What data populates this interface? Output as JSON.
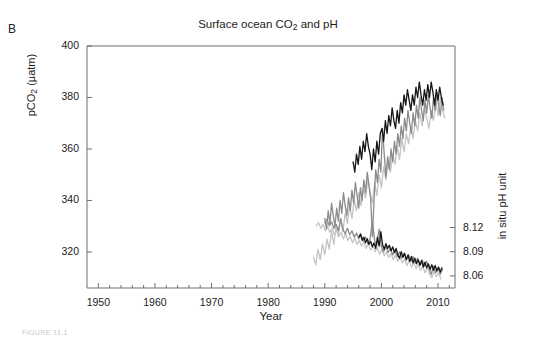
{
  "figure": {
    "panel_label": "B",
    "caption": "FIGURE 11.1"
  },
  "chart_data": {
    "type": "line",
    "title": "Surface ocean CO2 and pH",
    "title_main": "Surface ocean CO",
    "title_sub": "2",
    "title_tail": " and pH",
    "xlabel": "Year",
    "ylabel_main": "pCO",
    "ylabel_sub": "2",
    "ylabel_tail": " (µatm)",
    "ylabel": "pCO2 (µatm)",
    "y2label": "in situ pH unit",
    "xlim": [
      1948,
      2013
    ],
    "ylim": [
      306,
      400
    ],
    "y2lim": [
      8.045,
      8.135
    ],
    "xticks": [
      1950,
      1960,
      1970,
      1980,
      1990,
      2000,
      2010
    ],
    "xtick_labels": [
      "1950",
      "1960",
      "1970",
      "1980",
      "1990",
      "2000",
      "2010"
    ],
    "xminor_step": 2,
    "yticks": [
      320,
      340,
      360,
      380,
      400
    ],
    "ytick_labels": [
      "320",
      "340",
      "360",
      "380",
      "400"
    ],
    "y2ticks": [
      8.06,
      8.09,
      8.12
    ],
    "y2tick_labels": [
      "8.06",
      "8.09",
      "8.12"
    ],
    "grid": false,
    "legend": "none",
    "colors": {
      "series_black": "#161616",
      "series_gray": "#8c8c8c",
      "series_light": "#c4c4c4",
      "axis": "#6f6f6f"
    },
    "series": [
      {
        "name": "pCO2 station black",
        "axis": "left",
        "color": "#161616",
        "x": [
          1995.0,
          1995.3,
          1995.6,
          1995.9,
          1996.2,
          1996.5,
          1996.8,
          1997.1,
          1997.4,
          1997.7,
          1998.0,
          1998.3,
          1998.6,
          1998.9,
          1999.2,
          1999.5,
          1999.8,
          2000.1,
          2000.4,
          2000.7,
          2001.0,
          2001.3,
          2001.6,
          2001.9,
          2002.2,
          2002.5,
          2002.8,
          2003.1,
          2003.4,
          2003.7,
          2004.0,
          2004.3,
          2004.6,
          2004.9,
          2005.2,
          2005.5,
          2005.8,
          2006.1,
          2006.4,
          2006.7,
          2007.0,
          2007.3,
          2007.6,
          2007.9,
          2008.2,
          2008.5,
          2008.8,
          2009.1,
          2009.4,
          2009.7,
          2010.0,
          2010.3,
          2010.6,
          2010.9
        ],
        "y": [
          355.0,
          351.0,
          358.0,
          354.0,
          361.0,
          356.0,
          363.0,
          359.0,
          366.0,
          361.0,
          358.0,
          352.0,
          360.0,
          355.0,
          363.0,
          358.0,
          366.0,
          368.0,
          363.0,
          371.0,
          366.0,
          373.0,
          369.0,
          376.0,
          371.0,
          368.0,
          375.0,
          370.0,
          378.0,
          374.0,
          381.0,
          377.0,
          383.0,
          379.0,
          375.0,
          381.0,
          377.0,
          384.0,
          380.0,
          386.0,
          381.0,
          377.0,
          383.0,
          379.0,
          385.0,
          380.0,
          386.0,
          382.0,
          377.0,
          383.0,
          379.0,
          384.0,
          380.0,
          377.0
        ]
      },
      {
        "name": "pCO2 station gray",
        "axis": "left",
        "color": "#8c8c8c",
        "x": [
          1990.0,
          1990.3,
          1990.6,
          1990.9,
          1991.2,
          1991.5,
          1991.8,
          1992.1,
          1992.4,
          1992.7,
          1993.0,
          1993.3,
          1993.6,
          1993.9,
          1994.2,
          1994.5,
          1994.8,
          1995.1,
          1995.4,
          1995.7,
          1996.0,
          1996.3,
          1996.6,
          1996.9,
          1997.2,
          1997.5,
          1997.8,
          1998.1,
          1998.4,
          1998.7,
          1999.0,
          1999.3,
          1999.6,
          1999.9,
          2000.2,
          2000.5,
          2000.8,
          2001.1,
          2001.4,
          2001.7,
          2002.0,
          2002.3,
          2002.6,
          2002.9,
          2003.2,
          2003.5,
          2003.8,
          2004.1,
          2004.4,
          2004.7,
          2005.0,
          2005.3,
          2005.6,
          2005.9,
          2006.2,
          2006.5,
          2006.8,
          2007.1,
          2007.4,
          2007.7,
          2008.0,
          2008.3,
          2008.6,
          2008.9,
          2009.2,
          2009.5,
          2009.8,
          2010.1,
          2010.4,
          2010.7,
          2011.0
        ],
        "y": [
          333.0,
          329.0,
          336.0,
          331.0,
          339.0,
          334.0,
          330.0,
          337.0,
          332.0,
          340.0,
          335.0,
          343.0,
          338.0,
          334.0,
          341.0,
          336.0,
          344.0,
          339.0,
          347.0,
          342.0,
          337.0,
          345.0,
          340.0,
          348.0,
          343.0,
          351.0,
          346.0,
          341.0,
          326.0,
          340.0,
          352.0,
          347.0,
          356.0,
          351.0,
          368.0,
          358.0,
          349.0,
          357.0,
          352.0,
          360.0,
          355.0,
          363.0,
          358.0,
          366.0,
          361.0,
          369.0,
          364.0,
          372.0,
          367.0,
          375.0,
          370.0,
          366.0,
          374.0,
          369.0,
          377.0,
          372.0,
          380.0,
          375.0,
          371.0,
          379.0,
          374.0,
          381.0,
          376.0,
          372.0,
          380.0,
          375.0,
          382.0,
          377.0,
          373.0,
          380.0,
          375.0
        ]
      },
      {
        "name": "pCO2 station light",
        "axis": "left",
        "color": "#c4c4c4",
        "x": [
          1988.0,
          1988.4,
          1988.8,
          1989.2,
          1989.6,
          1990.0,
          1990.4,
          1990.8,
          1991.2,
          1991.6,
          1992.0,
          1992.4,
          1992.8,
          1993.2,
          1993.6,
          1994.0,
          1994.4,
          1994.8,
          1995.2,
          1995.6,
          1996.0,
          1996.4,
          1996.8,
          1997.2,
          1997.6,
          1998.0,
          1998.4,
          1998.8,
          1999.2,
          1999.6,
          2000.0,
          2000.4,
          2000.8,
          2001.2,
          2001.6,
          2002.0,
          2002.4,
          2002.8,
          2003.2,
          2003.6,
          2004.0,
          2004.4,
          2004.8,
          2005.2,
          2005.6,
          2006.0,
          2006.4,
          2006.8,
          2007.2,
          2007.6,
          2008.0,
          2008.4,
          2008.8,
          2009.2,
          2009.6,
          2010.0,
          2010.4,
          2010.8,
          2011.2
        ],
        "y": [
          318.0,
          315.0,
          321.0,
          317.0,
          323.0,
          319.0,
          325.0,
          321.0,
          328.0,
          323.0,
          330.0,
          326.0,
          333.0,
          328.0,
          335.0,
          331.0,
          338.0,
          333.0,
          340.0,
          336.0,
          343.0,
          338.0,
          345.0,
          341.0,
          348.0,
          343.0,
          339.0,
          347.0,
          342.0,
          350.0,
          345.0,
          353.0,
          348.0,
          356.0,
          351.0,
          358.0,
          354.0,
          361.0,
          356.0,
          364.0,
          359.0,
          366.0,
          362.0,
          369.0,
          364.0,
          371.0,
          367.0,
          374.0,
          369.0,
          376.0,
          372.0,
          368.0,
          375.0,
          371.0,
          378.0,
          373.0,
          380.0,
          375.0,
          372.0
        ]
      },
      {
        "name": "pH station black",
        "axis": "right",
        "color": "#161616",
        "x": [
          1996.0,
          1996.3,
          1996.6,
          1996.9,
          1997.2,
          1997.5,
          1997.8,
          1998.1,
          1998.4,
          1998.7,
          1999.0,
          1999.3,
          1999.6,
          1999.9,
          2000.2,
          2000.5,
          2000.8,
          2001.1,
          2001.4,
          2001.7,
          2002.0,
          2002.3,
          2002.6,
          2002.9,
          2003.2,
          2003.5,
          2003.8,
          2004.1,
          2004.4,
          2004.7,
          2005.0,
          2005.3,
          2005.6,
          2005.9,
          2006.2,
          2006.5,
          2006.8,
          2007.1,
          2007.4,
          2007.7,
          2008.0,
          2008.3,
          2008.6,
          2008.9,
          2009.2,
          2009.5,
          2009.8,
          2010.1,
          2010.4,
          2010.7
        ],
        "y": [
          8.108,
          8.112,
          8.104,
          8.108,
          8.101,
          8.106,
          8.099,
          8.103,
          8.096,
          8.101,
          8.094,
          8.108,
          8.097,
          8.115,
          8.099,
          8.093,
          8.1,
          8.094,
          8.098,
          8.091,
          8.096,
          8.089,
          8.094,
          8.086,
          8.082,
          8.09,
          8.083,
          8.088,
          8.08,
          8.086,
          8.078,
          8.084,
          8.076,
          8.082,
          8.075,
          8.08,
          8.073,
          8.079,
          8.071,
          8.077,
          8.07,
          8.075,
          8.068,
          8.074,
          8.067,
          8.073,
          8.066,
          8.071,
          8.065,
          8.07
        ]
      },
      {
        "name": "pH station gray",
        "axis": "right",
        "color": "#8c8c8c",
        "x": [
          1990.0,
          1990.4,
          1990.8,
          1991.2,
          1991.6,
          1992.0,
          1992.4,
          1992.8,
          1993.2,
          1993.6,
          1994.0,
          1994.4,
          1994.8,
          1995.2,
          1995.6,
          1996.0,
          1996.4,
          1996.8,
          1997.2,
          1997.6,
          1998.0,
          1998.4,
          1998.8,
          1999.2,
          1999.6,
          2000.0,
          2000.4,
          2000.8,
          2001.2,
          2001.6,
          2002.0,
          2002.4,
          2002.8,
          2003.2,
          2003.6,
          2004.0,
          2004.4,
          2004.8,
          2005.2,
          2005.6,
          2006.0,
          2006.4,
          2006.8,
          2007.2,
          2007.6,
          2008.0,
          2008.4,
          2008.8,
          2009.2,
          2009.6,
          2010.0,
          2010.4,
          2010.8
        ],
        "y": [
          8.126,
          8.13,
          8.122,
          8.127,
          8.119,
          8.124,
          8.116,
          8.131,
          8.118,
          8.112,
          8.119,
          8.111,
          8.116,
          8.108,
          8.113,
          8.106,
          8.111,
          8.103,
          8.108,
          8.1,
          8.106,
          8.128,
          8.104,
          8.098,
          8.118,
          8.096,
          8.09,
          8.097,
          8.089,
          8.094,
          8.086,
          8.092,
          8.084,
          8.09,
          8.082,
          8.088,
          8.08,
          8.086,
          8.078,
          8.084,
          8.076,
          8.082,
          8.074,
          8.08,
          8.072,
          8.078,
          8.07,
          8.062,
          8.072,
          8.064,
          8.07,
          8.062,
          8.068
        ]
      },
      {
        "name": "pH station light",
        "axis": "right",
        "color": "#c4c4c4",
        "x": [
          1988.5,
          1988.9,
          1989.3,
          1989.7,
          1990.1,
          1990.5,
          1990.9,
          1991.3,
          1991.7,
          1992.1,
          1992.5,
          1992.9,
          1993.3,
          1993.7,
          1994.1,
          1994.5,
          1994.9,
          1995.3,
          1995.7,
          1996.1,
          1996.5,
          1996.9,
          1997.3,
          1997.7,
          1998.1,
          1998.5,
          1998.9,
          1999.3,
          1999.7,
          2000.1,
          2000.5,
          2000.9,
          2001.3,
          2001.7,
          2002.1,
          2002.5,
          2002.9,
          2003.3,
          2003.7,
          2004.1,
          2004.5,
          2004.9,
          2005.3,
          2005.7,
          2006.1,
          2006.5,
          2006.9,
          2007.3,
          2007.7,
          2008.1,
          2008.5,
          2008.9,
          2009.3,
          2009.7,
          2010.1,
          2010.5
        ],
        "y": [
          8.122,
          8.126,
          8.119,
          8.124,
          8.116,
          8.121,
          8.114,
          8.119,
          8.111,
          8.116,
          8.109,
          8.114,
          8.106,
          8.112,
          8.104,
          8.109,
          8.101,
          8.107,
          8.099,
          8.104,
          8.097,
          8.102,
          8.094,
          8.1,
          8.092,
          8.097,
          8.09,
          8.095,
          8.087,
          8.093,
          8.085,
          8.09,
          8.083,
          8.088,
          8.08,
          8.086,
          8.078,
          8.083,
          8.076,
          8.081,
          8.073,
          8.079,
          8.071,
          8.076,
          8.069,
          8.074,
          8.067,
          8.072,
          8.064,
          8.07,
          8.062,
          8.058,
          8.066,
          8.059,
          8.064,
          8.056
        ]
      }
    ]
  }
}
